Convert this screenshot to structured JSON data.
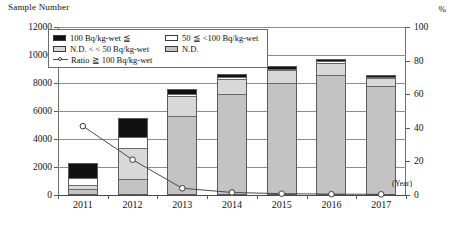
{
  "axis": {
    "y_left_title": "Sample Number",
    "y_right_title": "%",
    "x_unit": "(Year)",
    "y_left_ticks": [
      "12000",
      "10000",
      "8000",
      "6000",
      "4000",
      "2000",
      "0"
    ],
    "y_right_ticks": [
      "100",
      "80",
      "60",
      "40",
      "20",
      "0"
    ],
    "x_ticks": [
      "2011",
      "2012",
      "2013",
      "2014",
      "2015",
      "2016",
      "2017"
    ]
  },
  "legend": {
    "items": [
      {
        "label": "100 Bq/kg-wet ≦",
        "swatch": "black"
      },
      {
        "label": "50 ≦ <100 Bq/kg-wet",
        "swatch": "white"
      },
      {
        "label": "N.D. < < 50 Bq/kg-wet",
        "swatch": "lgray"
      },
      {
        "label": "N.D.",
        "swatch": "gray"
      },
      {
        "label": "Ratio ≧ 100 Bq/kg-wet",
        "swatch": "line-marker"
      }
    ]
  },
  "chart_data": {
    "type": "bar",
    "title": "",
    "xlabel": "(Year)",
    "ylabel": "Sample Number",
    "y2label": "%",
    "ylim": [
      0,
      12000
    ],
    "y2lim": [
      0,
      100
    ],
    "grid": true,
    "legend_position": "top-left-inside",
    "categories": [
      "2011",
      "2012",
      "2013",
      "2014",
      "2015",
      "2016",
      "2017"
    ],
    "series": [
      {
        "name": "100 Bq/kg-wet ≦",
        "color": "#111111",
        "values": [
          1100,
          1300,
          300,
          180,
          120,
          90,
          70
        ]
      },
      {
        "name": "50 ≦ <100 Bq/kg-wet",
        "color": "#ffffff",
        "values": [
          500,
          800,
          150,
          120,
          90,
          80,
          60
        ]
      },
      {
        "name": "N.D. < < 50 Bq/kg-wet",
        "color": "#d8d8d8",
        "values": [
          350,
          2300,
          1500,
          1100,
          950,
          900,
          600
        ]
      },
      {
        "name": "N.D.",
        "color": "#c3c3c3",
        "values": [
          350,
          1100,
          5650,
          7250,
          8040,
          8630,
          7870
        ]
      }
    ],
    "totals": [
      2300,
      5500,
      7600,
      8650,
      9200,
      9700,
      8600
    ],
    "ratio_series": {
      "name": "Ratio ≧ 100 Bq/kg-wet",
      "axis": "right",
      "unit": "%",
      "values": [
        41,
        21,
        4,
        1.5,
        0.8,
        0.5,
        0.4
      ]
    }
  }
}
